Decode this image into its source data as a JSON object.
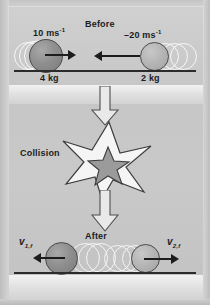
{
  "diagram": {
    "title_before": "Before",
    "title_collision": "Collision",
    "title_after": "After",
    "colors": {
      "background": "#c9c9c9",
      "ground": "#2b2b2b",
      "ball_dark": "#8f8f8f",
      "ball_light": "#b4b4b4",
      "arrow": "#1d1d1d",
      "burst_fill": "#f4f4f4",
      "burst_core": "#9a9a9a"
    },
    "before": {
      "ball_left": {
        "velocity_value": "10",
        "velocity_unit": "ms",
        "velocity_exponent": "-1",
        "mass_label": "4 kg",
        "direction": "right"
      },
      "ball_right": {
        "velocity_value": "–20",
        "velocity_unit": "ms",
        "velocity_exponent": "-1",
        "mass_label": "2 kg",
        "direction": "left"
      }
    },
    "after": {
      "ball_left": {
        "velocity_symbol": "v",
        "velocity_subscript": "1,f",
        "direction": "left"
      },
      "ball_right": {
        "velocity_symbol": "v",
        "velocity_subscript": "2,f",
        "direction": "right"
      }
    }
  }
}
